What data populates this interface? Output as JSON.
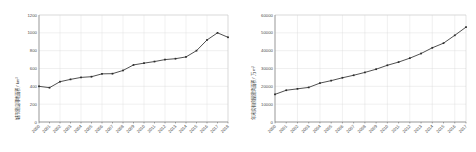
{
  "page": {
    "background": "#ffffff",
    "width": 476,
    "height": 152
  },
  "chart_data": [
    {
      "type": "line",
      "id": "urban-construction-land-area",
      "title": "",
      "xlabel": "",
      "ylabel": "城市建设用地面积 / km²",
      "ylim": [
        0,
        1200
      ],
      "yticks": [
        0,
        200,
        400,
        600,
        800,
        1000,
        1200
      ],
      "ytick_labels": [
        "0",
        "200",
        "400",
        "600",
        "800",
        "1000",
        "1200"
      ],
      "grid": true,
      "legend": "none",
      "line_color": "#3c3c3c",
      "marker": "square",
      "categories": [
        "2000",
        "2001",
        "2002",
        "2003",
        "2004",
        "2005",
        "2006",
        "2007",
        "2008",
        "2009",
        "2010",
        "2011",
        "2012",
        "2013",
        "2014",
        "2015",
        "2016",
        "2017",
        "2018"
      ],
      "x": [
        2000,
        2001,
        2002,
        2003,
        2004,
        2005,
        2006,
        2007,
        2008,
        2009,
        2010,
        2011,
        2012,
        2013,
        2014,
        2015,
        2016,
        2017,
        2018
      ],
      "values": [
        400,
        385,
        452,
        478,
        500,
        508,
        540,
        542,
        578,
        640,
        660,
        678,
        700,
        710,
        730,
        800,
        920,
        1000,
        950
      ]
    },
    {
      "type": "line",
      "id": "annual-housing-completed-floor-area",
      "title": "",
      "xlabel": "",
      "ylabel": "年末实有房屋建筑面积 / 万 m²",
      "ylim": [
        0,
        60000
      ],
      "yticks": [
        0,
        10000,
        20000,
        30000,
        40000,
        50000,
        60000
      ],
      "ytick_labels": [
        "0",
        "10000",
        "20000",
        "30000",
        "40000",
        "50000",
        "60000"
      ],
      "grid": true,
      "legend": "none",
      "line_color": "#3c3c3c",
      "marker": "square",
      "categories": [
        "2000",
        "2001",
        "2002",
        "2003",
        "2004",
        "2005",
        "2006",
        "2007",
        "2008",
        "2009",
        "2010",
        "2011",
        "2012",
        "2013",
        "2014",
        "2015",
        "2016",
        "2017"
      ],
      "x": [
        2000,
        2001,
        2002,
        2003,
        2004,
        2005,
        2006,
        2007,
        2008,
        2009,
        2010,
        2011,
        2012,
        2013,
        2014,
        2015,
        2016,
        2017
      ],
      "values": [
        15500,
        17800,
        18600,
        19400,
        21800,
        23200,
        24800,
        26200,
        27800,
        29600,
        31800,
        33600,
        35800,
        38400,
        41600,
        44200,
        48600,
        53200
      ]
    }
  ]
}
